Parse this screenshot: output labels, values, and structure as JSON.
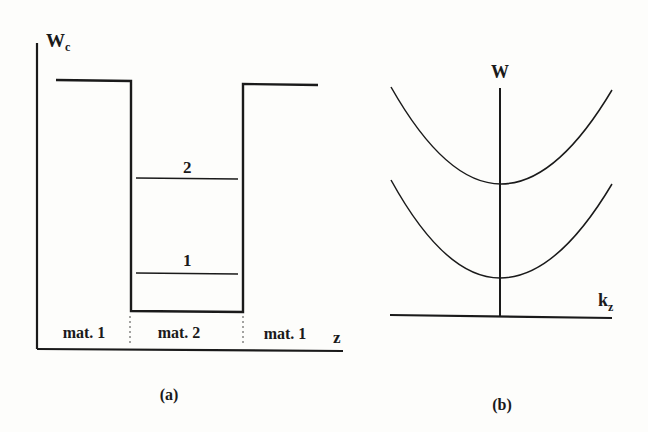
{
  "panel_a": {
    "y_axis_label": "W",
    "y_axis_subscript": "c",
    "x_axis_label": "z",
    "levels": [
      {
        "id": "2",
        "label": "2"
      },
      {
        "id": "1",
        "label": "1"
      }
    ],
    "regions": [
      {
        "label": "mat. 1"
      },
      {
        "label": "mat. 2"
      },
      {
        "label": "mat. 1"
      }
    ],
    "caption": "(a)"
  },
  "panel_b": {
    "y_axis_label": "W",
    "x_axis_label": "k",
    "x_axis_subscript": "z",
    "subbands": [
      {
        "id": "upper",
        "name": "subband 2"
      },
      {
        "id": "lower",
        "name": "subband 1"
      }
    ],
    "caption": "(b)"
  },
  "colors": {
    "ink": "#1a1a1a",
    "background": "#fdfdfb"
  }
}
